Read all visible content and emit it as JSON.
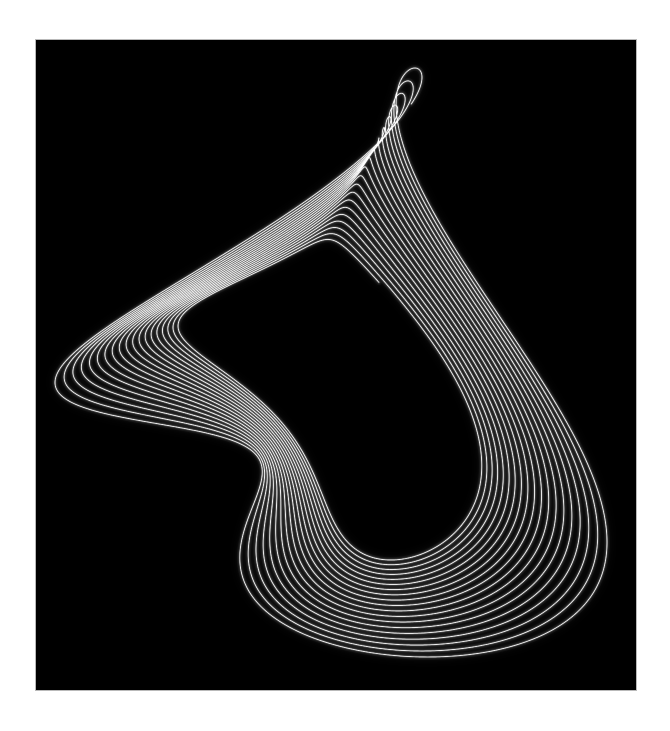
{
  "page": {
    "background_color": "#ffffff",
    "width": 670,
    "height": 731
  },
  "plot": {
    "background_color": "#000000",
    "border_color": "#b9b9b9",
    "left": 36,
    "top": 40,
    "width": 600,
    "height": 650,
    "caption": ""
  },
  "chart_data": {
    "type": "line",
    "title": "",
    "subtitle": "",
    "xlabel": "",
    "ylabel": "",
    "grid": false,
    "legend": "none",
    "axes_visible": false,
    "xlim": [
      -1.15,
      1.15
    ],
    "ylim": [
      -1.15,
      1.15
    ],
    "background": "#000000",
    "stroke_color": "#ffffff",
    "glow_color": "#ffffff",
    "description": "Damped harmonograph (Lissajous) curve: a large slowly-precessing outer ring of about ten nested arcs enclosing a brighter, tilted inner elliptical loop bundle that crosses itself near the top-left and lower-right, drawn as thin white glowing strokes on black.",
    "model": "harmonograph",
    "sampling": {
      "t_start": 0,
      "t_end": 120,
      "steps": 26000
    },
    "pendulums": [
      {
        "name": "x1",
        "axis": "x",
        "amplitude": 1.0,
        "frequency": 1.0,
        "phase": 0.0,
        "damping": 0.0042
      },
      {
        "name": "x2",
        "axis": "x",
        "amplitude": 0.42,
        "frequency": 3.01,
        "phase": 1.9,
        "damping": 0.011
      },
      {
        "name": "y1",
        "axis": "y",
        "amplitude": 1.0,
        "frequency": 1.004,
        "phase": 1.5708,
        "damping": 0.0042
      },
      {
        "name": "y2",
        "axis": "y",
        "amplitude": 0.4,
        "frequency": 2.0,
        "phase": 0.35,
        "damping": 0.009
      }
    ],
    "render": {
      "line_width_px": 0.62,
      "core_alpha": 0.3,
      "glow_layers": [
        {
          "blur_px": 1.2,
          "alpha": 0.16,
          "width_px": 1.1
        },
        {
          "blur_px": 4.5,
          "alpha": 0.085,
          "width_px": 2.6
        },
        {
          "blur_px": 11.0,
          "alpha": 0.045,
          "width_px": 5.5
        }
      ],
      "composite": "lighter"
    },
    "extent_px": {
      "left": 55,
      "right": 607,
      "top": 68,
      "bottom": 657
    }
  }
}
